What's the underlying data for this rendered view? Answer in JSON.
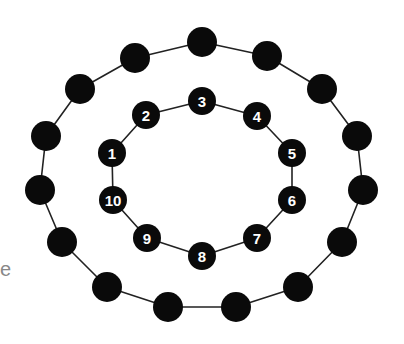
{
  "edge_text": "e",
  "colors": {
    "node": "#0a0a0a",
    "line": "#222222",
    "label": "#ffffff",
    "background": "#ffffff"
  },
  "outer_ring": {
    "nodes": [
      {
        "x": 202,
        "y": 42
      },
      {
        "x": 267,
        "y": 56
      },
      {
        "x": 322,
        "y": 89
      },
      {
        "x": 357,
        "y": 136
      },
      {
        "x": 363,
        "y": 190
      },
      {
        "x": 342,
        "y": 242
      },
      {
        "x": 298,
        "y": 287
      },
      {
        "x": 236,
        "y": 307
      },
      {
        "x": 168,
        "y": 307
      },
      {
        "x": 107,
        "y": 287
      },
      {
        "x": 62,
        "y": 242
      },
      {
        "x": 40,
        "y": 190
      },
      {
        "x": 46,
        "y": 136
      },
      {
        "x": 80,
        "y": 89
      },
      {
        "x": 135,
        "y": 58
      }
    ]
  },
  "inner_ring": {
    "nodes": [
      {
        "label": "1",
        "x": 112,
        "y": 153
      },
      {
        "label": "2",
        "x": 146,
        "y": 115
      },
      {
        "label": "3",
        "x": 202,
        "y": 101
      },
      {
        "label": "4",
        "x": 257,
        "y": 116
      },
      {
        "label": "5",
        "x": 292,
        "y": 153
      },
      {
        "label": "6",
        "x": 292,
        "y": 200
      },
      {
        "label": "7",
        "x": 257,
        "y": 238
      },
      {
        "label": "8",
        "x": 202,
        "y": 256
      },
      {
        "label": "9",
        "x": 147,
        "y": 238
      },
      {
        "label": "10",
        "x": 113,
        "y": 200
      }
    ]
  }
}
